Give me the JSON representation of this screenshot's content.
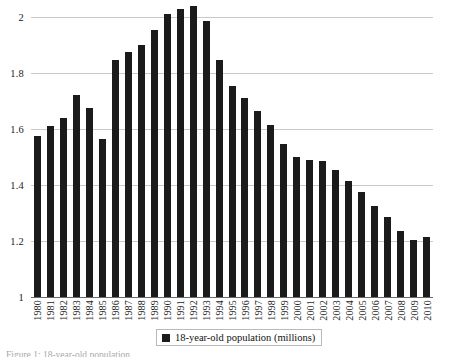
{
  "chart_data": {
    "type": "bar",
    "title": "",
    "subtitle": "",
    "xlabel": "",
    "ylabel": "",
    "ylim": [
      1,
      2.1
    ],
    "yticks": [
      1,
      1.2,
      1.4,
      1.6,
      1.8,
      2
    ],
    "ytick_labels": [
      "1",
      "1.2",
      "1.4",
      "1.6",
      "1.8",
      "2"
    ],
    "grid": "horizontal",
    "legend_position": "bottom-center",
    "bar_color": "#1b1b1b",
    "gridline_color": "#c9c9c9",
    "series": [
      {
        "name": "18-year-old population (millions)",
        "values": [
          1.575,
          1.61,
          1.64,
          1.72,
          1.675,
          1.565,
          1.845,
          1.875,
          1.9,
          1.955,
          2.01,
          2.03,
          2.04,
          1.985,
          1.845,
          1.755,
          1.71,
          1.665,
          1.615,
          1.545,
          1.5,
          1.49,
          1.485,
          1.455,
          1.415,
          1.375,
          1.325,
          1.285,
          1.235,
          1.205,
          1.215
        ]
      }
    ],
    "categories": [
      "1980",
      "1981",
      "1982",
      "1983",
      "1984",
      "1985",
      "1986",
      "1987",
      "1988",
      "1989",
      "1990",
      "1991",
      "1992",
      "1993",
      "1994",
      "1995",
      "1996",
      "1997",
      "1998",
      "1999",
      "2000",
      "2001",
      "2002",
      "2003",
      "2004",
      "2005",
      "2006",
      "2007",
      "2008",
      "2009",
      "2010"
    ],
    "legend": [
      {
        "label": "18-year-old population (millions)",
        "color": "#1b1b1b"
      }
    ]
  },
  "bottom_caption": "Figure 1: 18-year-old population"
}
